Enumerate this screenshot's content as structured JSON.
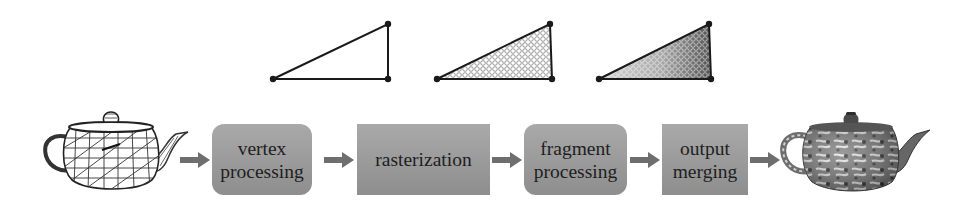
{
  "diagram": {
    "input_model": {
      "label": "wireframe teapot",
      "icon": "wireframe-teapot"
    },
    "output_model": {
      "label": "textured teapot",
      "icon": "textured-teapot"
    },
    "stages": [
      {
        "id": "vertex",
        "lines": [
          "vertex",
          "processing"
        ],
        "shape": "rounded"
      },
      {
        "id": "raster",
        "lines": [
          "rasterization"
        ],
        "shape": "square"
      },
      {
        "id": "fragment",
        "lines": [
          "fragment",
          "processing"
        ],
        "shape": "rounded"
      },
      {
        "id": "merge",
        "lines": [
          "output",
          "merging"
        ],
        "shape": "square"
      }
    ],
    "triangle_illustrations": [
      {
        "stage": "vertex",
        "content": "triangle vertices only"
      },
      {
        "stage": "rasterization",
        "content": "triangle filled with fragment grid (empty circles)"
      },
      {
        "stage": "fragment processing",
        "content": "fragments shaded in gray tones"
      }
    ],
    "colors": {
      "box_fill_top": "#a9a9a9",
      "box_fill_bottom": "#8e8e8e",
      "arrow": "#6e6e6e",
      "text": "#1e1e1e",
      "line": "#1a1a1a"
    }
  }
}
